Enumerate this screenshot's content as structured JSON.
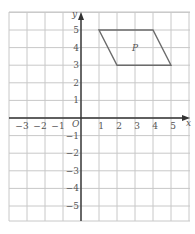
{
  "diagram": {
    "type": "coordinate-grid",
    "x_axis": {
      "label": "x",
      "min": -4,
      "max": 6,
      "ticks": [
        -3,
        -2,
        -1,
        1,
        2,
        3,
        4,
        5
      ]
    },
    "y_axis": {
      "label": "y",
      "min": -6,
      "max": 6,
      "ticks": [
        5,
        4,
        3,
        2,
        1,
        -1,
        -2,
        -3,
        -4,
        -5
      ]
    },
    "origin_label": "O",
    "shapes": [
      {
        "name": "P",
        "type": "parallelogram",
        "vertices": [
          [
            1,
            5
          ],
          [
            4,
            5
          ],
          [
            5,
            3
          ],
          [
            2,
            3
          ]
        ],
        "label_position": [
          3,
          4
        ]
      }
    ],
    "colors": {
      "grid": "#c8c8c8",
      "axes": "#333333",
      "shape": "#6b6b6b",
      "labels": "#555555"
    }
  }
}
